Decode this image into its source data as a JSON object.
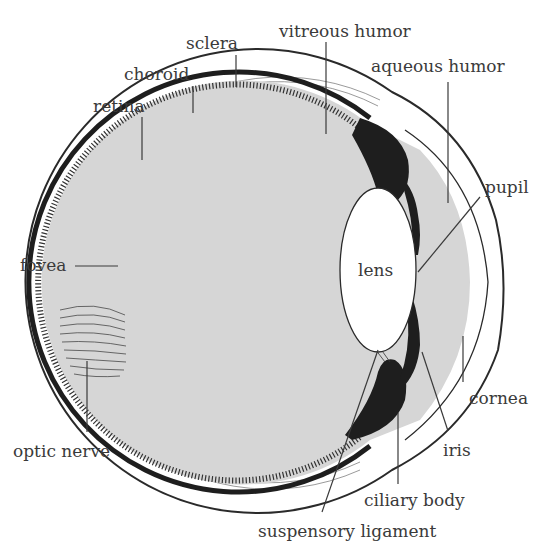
{
  "diagram": {
    "colors": {
      "background": "#ffffff",
      "humor_fill": "#d6d6d6",
      "pigment": "#1e1e1e",
      "line": "#3a3a3a",
      "lens_fill": "#ffffff"
    },
    "labels": {
      "sclera": "sclera",
      "choroid": "choroid",
      "retina": "retina",
      "vitreous_humor": "vitreous humor",
      "aqueous_humor": "aqueous humor",
      "pupil": "pupil",
      "fovea": "fovea",
      "lens": "lens",
      "optic_nerve": "optic nerve",
      "cornea": "cornea",
      "iris": "iris",
      "ciliary_body": "ciliary body",
      "suspensory_ligament": "suspensory ligament"
    }
  }
}
